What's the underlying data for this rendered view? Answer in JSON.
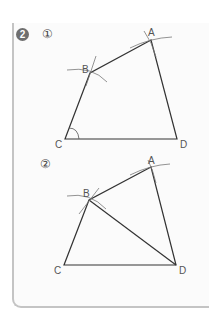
{
  "problem": {
    "number": "2",
    "figures": [
      {
        "id": "figure-1",
        "marker": "①",
        "points": {
          "A": {
            "x": 151,
            "y": 40,
            "label": "A"
          },
          "B": {
            "x": 90,
            "y": 73,
            "label": "B"
          },
          "C": {
            "x": 65,
            "y": 139,
            "label": "C"
          },
          "D": {
            "x": 177,
            "y": 139,
            "label": "D"
          }
        },
        "segments": [
          "AB",
          "BC",
          "CD",
          "DA"
        ],
        "angle_marks": [
          "C"
        ]
      },
      {
        "id": "figure-2",
        "marker": "②",
        "points": {
          "A": {
            "x": 151,
            "y": 167,
            "label": "A"
          },
          "B": {
            "x": 89,
            "y": 200,
            "label": "B"
          },
          "C": {
            "x": 64,
            "y": 265,
            "label": "C"
          },
          "D": {
            "x": 176,
            "y": 265,
            "label": "D"
          }
        },
        "segments": [
          "AB",
          "BC",
          "CD",
          "DA",
          "BD"
        ],
        "angle_marks": []
      }
    ]
  },
  "colors": {
    "line": "#333333",
    "arc": "#777777",
    "label": "#555555",
    "badge": "#6e6e6e",
    "card_border": "#c4c4c4"
  }
}
